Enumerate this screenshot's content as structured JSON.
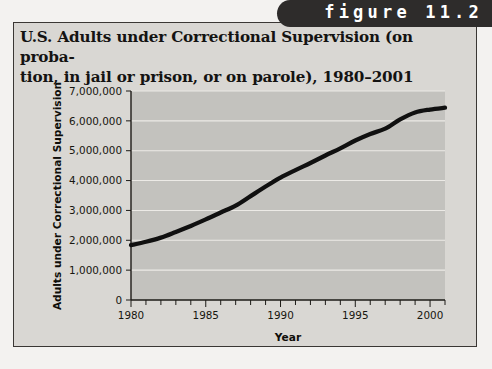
{
  "figure": {
    "tab_label": "figure 11.2",
    "title_line1": "U.S. Adults under Correctional Supervision (on proba-",
    "title_line2": "tion, in jail or prison, or on parole), 1980–2001"
  },
  "colors": {
    "page_background": "#f3f2f0",
    "panel_background": "#d9d7d3",
    "panel_border": "#3a3734",
    "tab_background": "#2e2c2b",
    "tab_text": "#ffffff",
    "plot_background": "#c3c2be",
    "gridline": "#eceae6",
    "line": "#101010",
    "axis": "#1d1b17",
    "text": "#141312"
  },
  "chart_data": {
    "type": "line",
    "xlabel": "Year",
    "ylabel": "Adults under Correctional Supervision",
    "xlim": [
      1980,
      2001
    ],
    "ylim": [
      0,
      7000000
    ],
    "grid": true,
    "legend": "none",
    "x_tick_labels": [
      "1980",
      "1985",
      "1990",
      "1995",
      "2000"
    ],
    "x_tick_values": [
      1980,
      1985,
      1990,
      1995,
      2000
    ],
    "x_minor_ticks_every": 1,
    "y_tick_labels": [
      "0",
      "1,000,000",
      "2,000,000",
      "3,000,000",
      "4,000,000",
      "5,000,000",
      "6,000,000",
      "7,000,000"
    ],
    "y_tick_values": [
      0,
      1000000,
      2000000,
      3000000,
      4000000,
      5000000,
      6000000,
      7000000
    ],
    "x": [
      1980,
      1981,
      1982,
      1983,
      1984,
      1985,
      1986,
      1987,
      1988,
      1989,
      1990,
      1991,
      1992,
      1993,
      1994,
      1995,
      1996,
      1997,
      1998,
      1999,
      2000,
      2001
    ],
    "values": [
      1840000,
      1950000,
      2090000,
      2280000,
      2480000,
      2700000,
      2930000,
      3160000,
      3480000,
      3800000,
      4100000,
      4350000,
      4590000,
      4840000,
      5080000,
      5340000,
      5560000,
      5740000,
      6050000,
      6280000,
      6380000,
      6440000
    ],
    "series": [
      {
        "name": "Adults under Correctional Supervision",
        "values": [
          1840000,
          1950000,
          2090000,
          2280000,
          2480000,
          2700000,
          2930000,
          3160000,
          3480000,
          3800000,
          4100000,
          4350000,
          4590000,
          4840000,
          5080000,
          5340000,
          5560000,
          5740000,
          6050000,
          6280000,
          6380000,
          6440000
        ]
      }
    ]
  }
}
